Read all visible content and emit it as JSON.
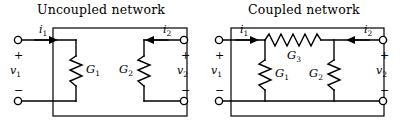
{
  "figure": {
    "kind": "two-port-network-schematic",
    "background_color": "#ffffff",
    "line_color": "#000000"
  },
  "networks": [
    {
      "id": "uncoupled",
      "title": "Uncoupled network",
      "ports": {
        "left": {
          "current_label": "i",
          "current_sub": "1",
          "current_direction": "into-network",
          "voltage_label": "v",
          "voltage_sub": "1",
          "plus_sign": "+",
          "minus_sign": "−"
        },
        "right": {
          "current_label": "i",
          "current_sub": "2",
          "current_direction": "into-network",
          "voltage_label": "v",
          "voltage_sub": "2",
          "plus_sign": "+",
          "minus_sign": "−"
        }
      },
      "elements": [
        {
          "name": "G",
          "sub": "1",
          "symbol": "resistor",
          "orientation": "vertical",
          "label_side": "right"
        },
        {
          "name": "G",
          "sub": "2",
          "symbol": "resistor",
          "orientation": "vertical",
          "label_side": "left"
        }
      ]
    },
    {
      "id": "coupled",
      "title": "Coupled network",
      "ports": {
        "left": {
          "current_label": "i",
          "current_sub": "1",
          "current_direction": "into-network",
          "voltage_label": "v",
          "voltage_sub": "1",
          "plus_sign": "+",
          "minus_sign": "−"
        },
        "right": {
          "current_label": "i",
          "current_sub": "2",
          "current_direction": "into-network",
          "voltage_label": "v",
          "voltage_sub": "2",
          "plus_sign": "+",
          "minus_sign": "−"
        }
      },
      "elements": [
        {
          "name": "G",
          "sub": "1",
          "symbol": "resistor",
          "orientation": "vertical",
          "label_side": "right"
        },
        {
          "name": "G",
          "sub": "2",
          "symbol": "resistor",
          "orientation": "vertical",
          "label_side": "left"
        },
        {
          "name": "G",
          "sub": "3",
          "symbol": "resistor",
          "orientation": "horizontal",
          "label_side": "below"
        }
      ]
    }
  ]
}
